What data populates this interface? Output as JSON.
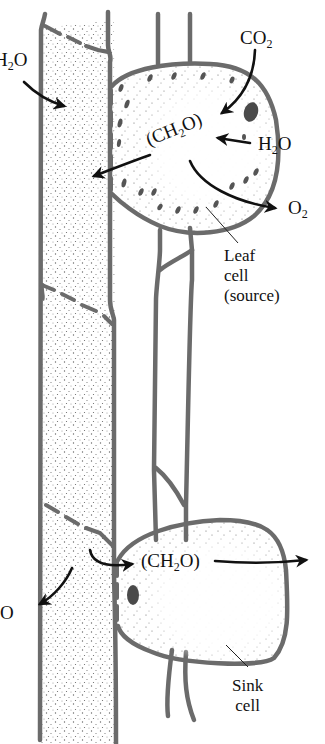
{
  "diagram": {
    "colors": {
      "outline": "#6b6b6b",
      "stipple": "#555555",
      "arrow": "#111111",
      "chloroplast": "#4a4a4a",
      "background": "#ffffff"
    },
    "labels": {
      "h2o_top_left": {
        "main": "H",
        "sub": "2",
        "tail": "O"
      },
      "co2": {
        "main": "CO",
        "sub": "2"
      },
      "ch2o_source": {
        "open": "(CH",
        "sub": "2",
        "tail": "O)"
      },
      "h2o_source": {
        "main": "H",
        "sub": "2",
        "tail": "O"
      },
      "o2": {
        "main": "O",
        "sub": "2"
      },
      "leaf_cell": [
        "Leaf",
        "cell",
        "(source)"
      ],
      "ch2o_sink": {
        "open": "(CH",
        "sub": "2",
        "tail": "O)"
      },
      "h2o_bottom_left": {
        "main": "",
        "sub": "2",
        "tail": "O"
      },
      "sink_cell": [
        "Sink",
        "cell"
      ]
    },
    "structures": [
      "sieve-tube (phloem, stippled)",
      "xylem vessel (unstippled)",
      "leaf source cell with chloroplasts",
      "sink cell"
    ],
    "arrows": [
      "H2O into sieve tube (top left)",
      "CO2 into leaf cell",
      "H2O into leaf cell",
      "(CH2O) from leaf cell into sieve tube",
      "O2 out of leaf cell",
      "(CH2O) from sieve tube into sink cell and onward",
      "H2O out of sieve tube (bottom left)"
    ]
  }
}
